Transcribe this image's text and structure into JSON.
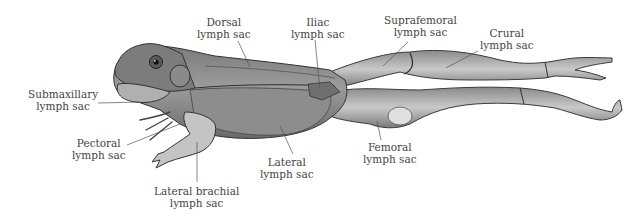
{
  "figure": {
    "colors": {
      "skin_dark": "#6e6e6e",
      "skin_mid": "#9a9a9a",
      "skin_light": "#cfcfcf",
      "outline": "#3a3a3a",
      "leader": "#555555"
    }
  },
  "labels": [
    {
      "id": "dorsal",
      "line1": "Dorsal",
      "line2": "lymph sac",
      "x": 197,
      "y": 16
    },
    {
      "id": "iliac",
      "line1": "Iliac",
      "line2": "lymph sac",
      "x": 291,
      "y": 16
    },
    {
      "id": "suprafemoral",
      "line1": "Suprafemoral",
      "line2": "lymph sac",
      "x": 384,
      "y": 14
    },
    {
      "id": "crural",
      "line1": "Crural",
      "line2": "lymph sac",
      "x": 480,
      "y": 27
    },
    {
      "id": "submaxillary",
      "line1": "Submaxillary",
      "line2": "lymph sac",
      "x": 28,
      "y": 88
    },
    {
      "id": "pectoral",
      "line1": "Pectoral",
      "line2": "lymph sac",
      "x": 72,
      "y": 137
    },
    {
      "id": "lateral",
      "line1": "Lateral",
      "line2": "lymph sac",
      "x": 260,
      "y": 156
    },
    {
      "id": "femoral",
      "line1": "Femoral",
      "line2": "lymph sac",
      "x": 363,
      "y": 141
    },
    {
      "id": "lateral_brachial",
      "line1": "Lateral brachial",
      "line2": "lymph sac",
      "x": 154,
      "y": 185
    }
  ]
}
